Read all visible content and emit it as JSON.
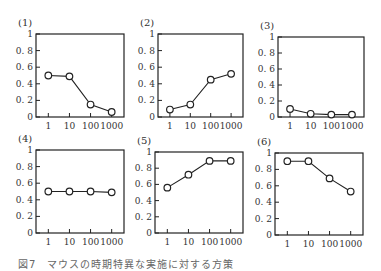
{
  "chart_data": [
    {
      "type": "line",
      "title": "(1)",
      "categories": [
        "1",
        "10",
        "100",
        "1000"
      ],
      "values": [
        0.5,
        0.49,
        0.15,
        0.06
      ],
      "yticks": [
        "0",
        "0.2",
        "0.4",
        "0.6",
        "0.8",
        "1"
      ],
      "ylim": [
        0,
        1
      ],
      "xlabel": "",
      "ylabel": "",
      "grid": false,
      "markers": "open-circle"
    },
    {
      "type": "line",
      "title": "(2)",
      "categories": [
        "1",
        "10",
        "100",
        "1000"
      ],
      "values": [
        0.09,
        0.15,
        0.45,
        0.52
      ],
      "yticks": [
        "0",
        "0.2",
        "0.4",
        "0.6",
        "0.8",
        "1"
      ],
      "ylim": [
        0,
        1
      ],
      "xlabel": "",
      "ylabel": "",
      "grid": false,
      "markers": "open-circle"
    },
    {
      "type": "line",
      "title": "(3)",
      "categories": [
        "1",
        "10",
        "100",
        "1000"
      ],
      "values": [
        0.1,
        0.04,
        0.03,
        0.03
      ],
      "yticks": [
        "0",
        "0.2",
        "0.4",
        "0.6",
        "0.8",
        "1"
      ],
      "ylim": [
        0,
        1
      ],
      "xlabel": "",
      "ylabel": "",
      "grid": false,
      "markers": "open-circle"
    },
    {
      "type": "line",
      "title": "(4)",
      "categories": [
        "1",
        "10",
        "100",
        "1000"
      ],
      "values": [
        0.5,
        0.5,
        0.5,
        0.49
      ],
      "yticks": [
        "0",
        "0.2",
        "0.4",
        "0.6",
        "0.8",
        "1"
      ],
      "ylim": [
        0,
        1
      ],
      "xlabel": "",
      "ylabel": "",
      "grid": false,
      "markers": "open-circle"
    },
    {
      "type": "line",
      "title": "(5)",
      "categories": [
        "1",
        "10",
        "100",
        "1000"
      ],
      "values": [
        0.56,
        0.72,
        0.89,
        0.89
      ],
      "yticks": [
        "0",
        "0.2",
        "0.4",
        "0.6",
        "0.8",
        "1"
      ],
      "ylim": [
        0,
        1
      ],
      "xlabel": "",
      "ylabel": "",
      "grid": false,
      "markers": "open-circle"
    },
    {
      "type": "line",
      "title": "(6)",
      "categories": [
        "1",
        "10",
        "100",
        "1000"
      ],
      "values": [
        0.9,
        0.9,
        0.69,
        0.53
      ],
      "yticks": [
        "0",
        "0.2",
        "0.4",
        "0.6",
        "0.8",
        "1"
      ],
      "ylim": [
        0,
        1
      ],
      "xlabel": "",
      "ylabel": "",
      "grid": false,
      "markers": "open-circle"
    }
  ],
  "caption": "図7　マウスの時期特異な実施に対する方策"
}
